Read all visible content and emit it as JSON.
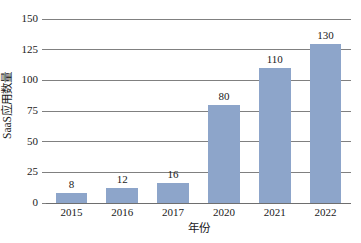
{
  "chart_data": {
    "type": "bar",
    "title": "",
    "xlabel": "年份",
    "ylabel": "SaaS应用数量",
    "categories": [
      "2015",
      "2016",
      "2017",
      "2020",
      "2021",
      "2022"
    ],
    "values": [
      8,
      12,
      16,
      80,
      110,
      130
    ],
    "value_labels": [
      "8",
      "12",
      "16",
      "80",
      "110",
      "130"
    ],
    "series": [
      {
        "name": "SaaS应用数量",
        "values": [
          8,
          12,
          16,
          80,
          110,
          130
        ]
      }
    ],
    "ylim": [
      0,
      150
    ],
    "yticks": [
      0,
      25,
      50,
      75,
      100,
      125,
      150
    ],
    "ytick_labels": [
      "0",
      "25",
      "50",
      "75",
      "100",
      "125",
      "150"
    ],
    "grid": true,
    "legend": false,
    "legend_position": "none",
    "bar_color": "#8da5ca",
    "grid_color": "#808080",
    "axis_color": "#6e6e6e",
    "background_color": "#ffffff",
    "text_color": "#1a1a1a"
  }
}
